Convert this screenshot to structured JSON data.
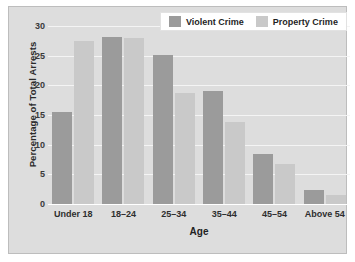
{
  "chart_data": {
    "type": "bar",
    "title": "",
    "xlabel": "Age",
    "ylabel": "Percentage of Total Arrests",
    "categories": [
      "Under 18",
      "18–24",
      "25–34",
      "35–44",
      "45–54",
      "Above 54"
    ],
    "series": [
      {
        "name": "Violent Crime",
        "color": "#9b9b9b",
        "values": [
          15.5,
          28.2,
          25.1,
          19.0,
          8.4,
          2.3
        ]
      },
      {
        "name": "Property Crime",
        "color": "#c9c9c9",
        "values": [
          27.5,
          28.0,
          18.7,
          13.9,
          6.7,
          1.6
        ]
      }
    ],
    "ylim": [
      0,
      30
    ],
    "yticks": [
      0,
      5,
      10,
      15,
      20,
      25,
      30
    ],
    "ytick_labels": [
      "0",
      "5",
      "10",
      "15",
      "20",
      "25",
      "30"
    ],
    "grid": true,
    "grid_axis": "y",
    "legend_position": "top-right",
    "background_color": "#dddddd",
    "gridline_color": "#f4f4f4",
    "axis_color": "#ffffff"
  },
  "legend": {
    "entries": [
      {
        "label": "Violent Crime",
        "swatch": "violent"
      },
      {
        "label": "Property Crime",
        "swatch": "property"
      }
    ]
  }
}
